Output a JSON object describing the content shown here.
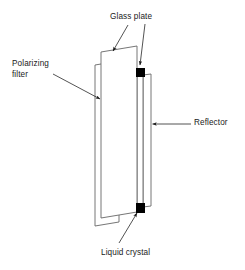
{
  "diagram": {
    "background_color": "#ffffff",
    "stroke_color": "#555555",
    "fill_color": "#ffffff",
    "accent_color": "#000000",
    "text_color": "#1a1a1a",
    "labels": {
      "glass_plate": "Glass plate",
      "polarizing_filter_line1": "Polarizing",
      "polarizing_filter_line2": "filter",
      "reflector": "Reflector",
      "liquid_crystal": "Liquid crystal"
    },
    "layers": [
      {
        "name": "polarizing-filter-layer",
        "label": "Polarizing filter",
        "points": "95,65 119,61 119,222 95,226"
      },
      {
        "name": "front-glass-plate-layer",
        "label": "Glass plate",
        "points": "101,52 137,46 137,212 101,218"
      },
      {
        "name": "liquid-crystal-cell-layer",
        "label": "Liquid crystal",
        "points": "137,70 143,69 143,211 137,212"
      },
      {
        "name": "reflector-layer",
        "label": "Reflector",
        "points": "143,75 151,74 151,206 143,207"
      }
    ],
    "spacers": [
      {
        "name": "top-spacer",
        "x": 136,
        "y": 68,
        "width": 9,
        "height": 9
      },
      {
        "name": "bottom-spacer",
        "x": 136,
        "y": 203,
        "width": 9,
        "height": 10
      }
    ],
    "leader_lines": [
      {
        "name": "glass-plate-leader-left",
        "from_x": 128,
        "from_y": 25,
        "to_x": 113,
        "to_y": 51
      },
      {
        "name": "glass-plate-leader-right",
        "from_x": 145,
        "from_y": 24,
        "to_x": 140,
        "to_y": 65
      },
      {
        "name": "polarizing-filter-leader",
        "from_x": 53,
        "from_y": 74,
        "to_x": 100,
        "to_y": 99
      },
      {
        "name": "reflector-leader",
        "from_x": 191,
        "from_y": 124,
        "to_x": 152,
        "to_y": 124
      },
      {
        "name": "liquid-crystal-leader",
        "from_x": 119,
        "from_y": 243,
        "to_x": 137,
        "to_y": 213
      }
    ]
  }
}
